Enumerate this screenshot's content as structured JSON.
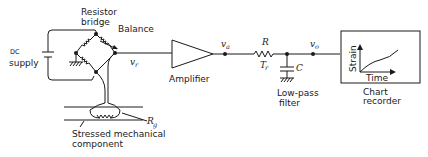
{
  "diagram": {
    "labels": {
      "dc": "DC",
      "supply": "supply",
      "resistor": "Resistor",
      "bridge": "bridge",
      "balance": "Balance",
      "vr": "v",
      "vr_sub": "r",
      "amplifier": "Amplifier",
      "va": "v",
      "va_sub": "a",
      "R": "R",
      "Tr": "T",
      "Tr_sub": "r",
      "C": "C",
      "vo": "v",
      "vo_sub": "o",
      "lowpass1": "Low-pass",
      "lowpass2": "filter",
      "chart1": "Chart",
      "chart2": "recorder",
      "strain": "Strain",
      "time": "Time",
      "rg": "R",
      "rg_sub": "g",
      "stressed1": "Stressed mechanical",
      "stressed2": "component"
    },
    "colors": {
      "stroke": "#1a1a1a",
      "background": "#ffffff"
    }
  }
}
